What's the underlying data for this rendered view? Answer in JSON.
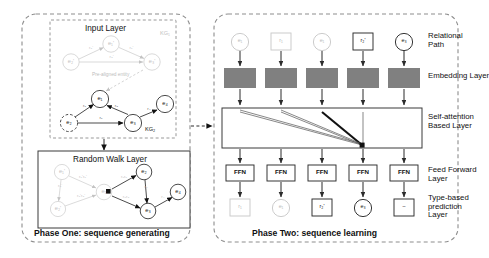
{
  "figure": {
    "type": "diagram"
  },
  "phase_one": {
    "title": "Phase One: sequence generating",
    "input_layer": {
      "title": "Input Layer",
      "kg1_label": "KG₁",
      "kg2_label": "KG₂",
      "prealigned_label": "Pre-aligned entity",
      "kg1_nodes": [
        {
          "id": "kg1-e1",
          "label": "e₁'",
          "x": 111,
          "y": 44
        },
        {
          "id": "kg1-e2",
          "label": "e₂'",
          "x": 71,
          "y": 62
        },
        {
          "id": "kg1-e3",
          "label": "e₃'",
          "x": 152,
          "y": 62
        }
      ],
      "kg1_edges": [
        {
          "from": "kg1-e2",
          "to": "kg1-e1",
          "label": "r₂'"
        },
        {
          "from": "kg1-e1",
          "to": "kg1-e3",
          "label": "r₁'"
        },
        {
          "from": "kg1-e2",
          "to": "kg1-e3",
          "label": "r₃'"
        }
      ],
      "kg2_nodes": [
        {
          "id": "kg2-e1",
          "label": "e₁",
          "x": 100,
          "y": 99
        },
        {
          "id": "kg2-e2",
          "label": "e₂",
          "x": 69,
          "y": 123
        },
        {
          "id": "kg2-e3",
          "label": "e₃",
          "x": 133,
          "y": 123
        },
        {
          "id": "kg2-e4",
          "label": "e₄",
          "x": 165,
          "y": 104
        }
      ],
      "kg2_edges": [
        {
          "from": "kg2-e2",
          "to": "kg2-e1",
          "label": "r₁"
        },
        {
          "from": "kg2-e2",
          "to": "kg2-e3",
          "label": "r₂"
        },
        {
          "from": "kg2-e3",
          "to": "kg2-e1",
          "label": "r₃"
        },
        {
          "from": "kg2-e3",
          "to": "kg2-e4",
          "label": "r₄"
        }
      ]
    },
    "random_walk_layer": {
      "title": "Random Walk Layer",
      "nodes": [
        {
          "id": "rw-e1p",
          "label": "e₁'",
          "x": 62,
          "y": 172,
          "faded": true
        },
        {
          "id": "rw-e2p",
          "label": "e₂'",
          "x": 58,
          "y": 209,
          "faded": true
        },
        {
          "id": "rw-center",
          "label": "e₁",
          "x": 104,
          "y": 192,
          "faded": true
        },
        {
          "id": "rw-e2",
          "label": "e₂",
          "x": 144,
          "y": 172
        },
        {
          "id": "rw-e3",
          "label": "e₃",
          "x": 148,
          "y": 211
        },
        {
          "id": "rw-e4",
          "label": "e₄",
          "x": 178,
          "y": 192
        }
      ],
      "edges": [
        {
          "from": "rw-e1p",
          "to": "rw-center",
          "label": "r₁'r₂'"
        },
        {
          "from": "rw-e1p",
          "to": "rw-e2p",
          "label": "r₃'"
        },
        {
          "from": "rw-e2p",
          "to": "rw-center",
          "label": "r₂'r₃'"
        },
        {
          "from": "rw-center",
          "to": "rw-e2",
          "label": "r₁r₂"
        },
        {
          "from": "rw-center",
          "to": "rw-e3",
          "label": "r₂r₃"
        },
        {
          "from": "rw-e2",
          "to": "rw-e3",
          "label": "r₃"
        },
        {
          "from": "rw-e3",
          "to": "rw-e4",
          "label": "r₄"
        }
      ]
    }
  },
  "phase_two": {
    "title": "Phase Two: sequence learning",
    "side_labels": [
      {
        "id": "relational-path",
        "text": "Relational\nPath"
      },
      {
        "id": "embedding-layer",
        "text": "Embedding Layer"
      },
      {
        "id": "self-attention-layer",
        "text": "Self-attention\nBased Layer"
      },
      {
        "id": "feed-forward-layer",
        "text": "Feed Forward\nLayer"
      },
      {
        "id": "type-based-prediction-layer",
        "text": "Type-based\nprediction\nLayer"
      }
    ],
    "columns": [
      {
        "index": 0,
        "x": 240,
        "input_token": "e₁",
        "input_shape": "circle",
        "input_faded": true,
        "output_token": "r₁",
        "output_shape": "box",
        "output_faded": true
      },
      {
        "index": 1,
        "x": 281,
        "input_token": "r₁",
        "input_shape": "box",
        "input_faded": true,
        "output_token": "e₁",
        "output_shape": "circle",
        "output_faded": true
      },
      {
        "index": 2,
        "x": 322,
        "input_token": "e₁",
        "input_shape": "circle",
        "input_faded": true,
        "output_token": "r₂'",
        "output_shape": "box",
        "output_faded": false
      },
      {
        "index": 3,
        "x": 363,
        "input_token": "r₂'",
        "input_shape": "box",
        "input_faded": false,
        "output_token": "e₃",
        "output_shape": "circle",
        "output_faded": false
      },
      {
        "index": 4,
        "x": 404,
        "input_token": "e₃",
        "input_shape": "circle",
        "input_faded": false,
        "output_token": "–",
        "output_shape": "box",
        "output_faded": false
      }
    ],
    "ffn_label": "FFN",
    "embedding_box_color": "#808080",
    "attention_target_column": 3
  },
  "connector": {
    "id": "phase-connector",
    "style": "dashed-arrow"
  }
}
